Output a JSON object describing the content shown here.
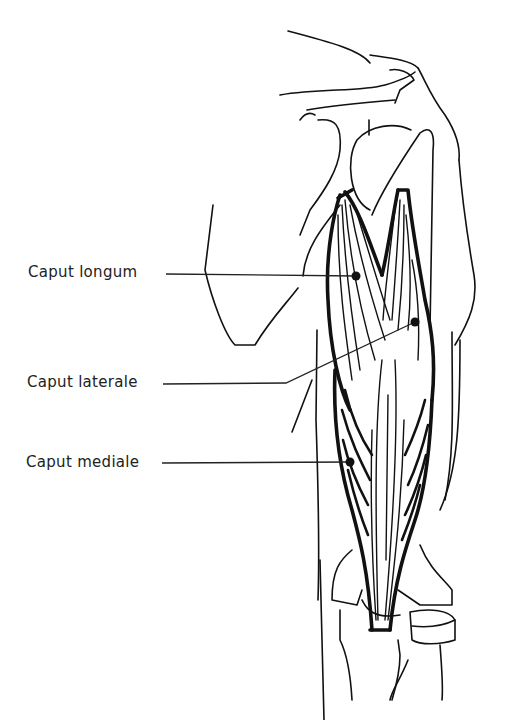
{
  "figure": {
    "labels": [
      {
        "id": "caput-longum",
        "text": "Caput longum",
        "x": 28,
        "y": 263,
        "lead_from": [
          166,
          274
        ],
        "lead_to": [
          356,
          276
        ]
      },
      {
        "id": "caput-laterale",
        "text": "Caput laterale",
        "x": 27,
        "y": 373,
        "lead_from": [
          163,
          384
        ],
        "lead_to": [
          415,
          322
        ]
      },
      {
        "id": "caput-mediale",
        "text": "Caput mediale",
        "x": 26,
        "y": 453,
        "lead_from": [
          162,
          463
        ],
        "lead_to": [
          350,
          462
        ]
      }
    ],
    "colors": {
      "line": "#111111",
      "text": "#222222",
      "background": "#ffffff"
    }
  }
}
